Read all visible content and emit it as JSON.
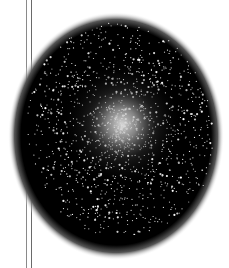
{
  "image": {
    "subject": "globular star cluster",
    "background": "#ffffff",
    "cluster": {
      "shape": "ellipse",
      "center": [
        116,
        136
      ],
      "radii": [
        106,
        122
      ],
      "core_color": "#e8e8e8",
      "field_color": "#000000",
      "halo_color": "#ffffff"
    },
    "lines": [
      {
        "x": 26,
        "color": "#8a8a8a"
      },
      {
        "x": 31,
        "color": "#6a6a6a"
      }
    ]
  }
}
